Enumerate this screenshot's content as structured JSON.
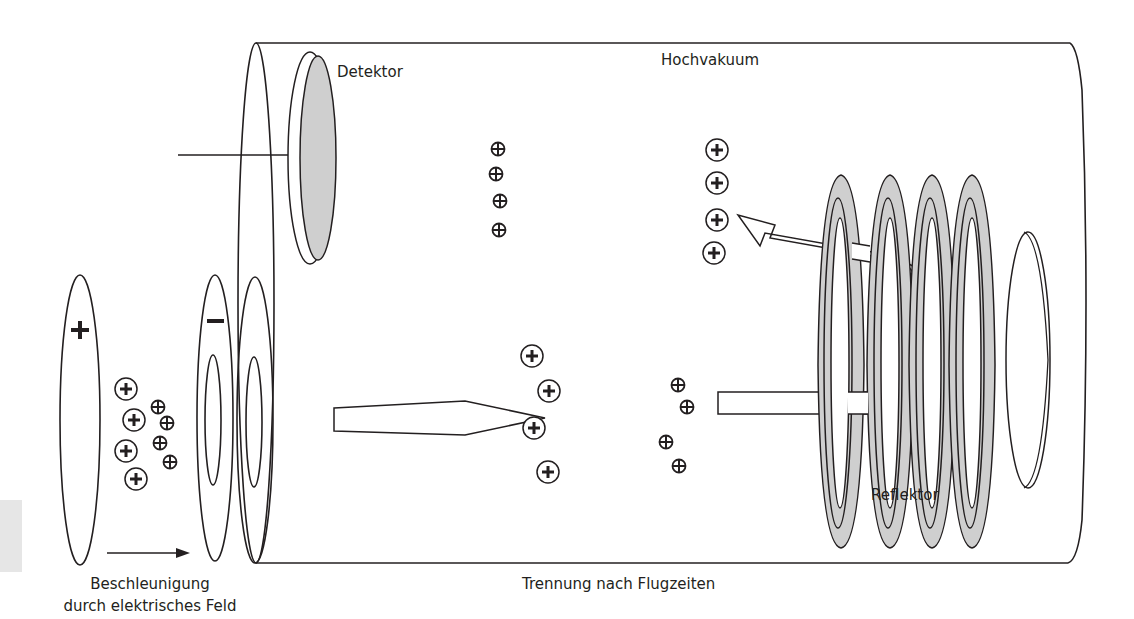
{
  "diagram": {
    "labels": {
      "detector": "Detektor",
      "vacuum": "Hochvakuum",
      "reflector": "Reflektor",
      "separation": "Trennung nach Flugzeiten",
      "acceleration_line1": "Beschleunigung",
      "acceleration_line2": "durch elektrisches Feld"
    },
    "plate_signs": {
      "positive": "+",
      "negative": "−"
    },
    "ion_symbol": "⊕",
    "colors": {
      "stroke": "#231f20",
      "fill_gray": "#cfcfcf",
      "background": "#ffffff"
    },
    "ion_groups": [
      {
        "name": "source-ions-large",
        "size": "large",
        "count": 4
      },
      {
        "name": "source-ions-small",
        "size": "small",
        "count": 4
      },
      {
        "name": "upper-ions-small",
        "size": "small",
        "count": 4
      },
      {
        "name": "upper-ions-large",
        "size": "large",
        "count": 4
      },
      {
        "name": "lower-ions-large",
        "size": "large",
        "count": 4
      },
      {
        "name": "lower-ions-small",
        "size": "small",
        "count": 4
      }
    ],
    "reflector_ring_count": 4
  }
}
